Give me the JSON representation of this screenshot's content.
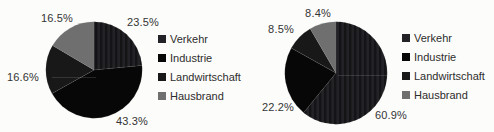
{
  "figure": {
    "background": "#fcfcfa",
    "text_color": "#343434"
  },
  "chart_data": [
    {
      "type": "pie",
      "title": "",
      "unit": "%",
      "categories": [
        "Verkehr",
        "Industrie",
        "Landwirtschaft",
        "Hausbrand"
      ],
      "values": [
        23.5,
        43.3,
        16.6,
        16.5
      ],
      "labels": [
        "23.5%",
        "43.3%",
        "16.6%",
        "16.5%"
      ],
      "colors": [
        "#232327",
        "#070707",
        "#181818",
        "#6f6f6f"
      ],
      "textured_slices": [
        0
      ],
      "start_angle_deg": 0,
      "direction": "clockwise",
      "legend_position": "right",
      "legend_entries": [
        "Verkehr",
        "Industrie",
        "Landwirtschaft",
        "Hausbrand"
      ]
    },
    {
      "type": "pie",
      "title": "",
      "unit": "%",
      "categories": [
        "Verkehr",
        "Industrie",
        "Landwirtschaft",
        "Hausbrand"
      ],
      "values": [
        60.9,
        22.2,
        8.5,
        8.4
      ],
      "labels": [
        "60.9%",
        "22.2%",
        "8.5%",
        "8.4%"
      ],
      "colors": [
        "#232327",
        "#070707",
        "#181818",
        "#6f6f6f"
      ],
      "textured_slices": [
        0
      ],
      "start_angle_deg": 0,
      "direction": "clockwise",
      "legend_position": "right",
      "legend_entries": [
        "Verkehr",
        "Industrie",
        "Landwirtschaft",
        "Hausbrand"
      ]
    }
  ]
}
